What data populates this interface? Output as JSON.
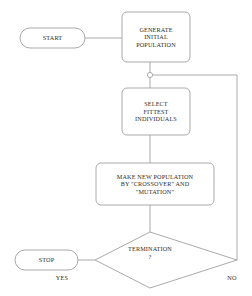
{
  "diagram": {
    "stroke_color": "#a0a0a0",
    "text_color": "#2b2b2b",
    "background_color": "#ffffff",
    "nodes": [
      {
        "id": "start",
        "shape": "stadium",
        "label": "START"
      },
      {
        "id": "generate",
        "shape": "rounded-rect",
        "label": "GENERATE\nINITIAL\nPOPULATION"
      },
      {
        "id": "junction",
        "shape": "circle",
        "label": ""
      },
      {
        "id": "select",
        "shape": "rounded-rect",
        "label": "SELECT\nFITTEST\nINDIVIDUALS"
      },
      {
        "id": "make",
        "shape": "rounded-rect",
        "label": "MAKE NEW POPULATION\nBY \"CROSSOVER\" AND\n\"MUTATION\""
      },
      {
        "id": "termination",
        "shape": "diamond",
        "label": "TERMINATION\n?"
      },
      {
        "id": "stop",
        "shape": "stadium",
        "label": "STOP"
      }
    ],
    "edge_labels": {
      "yes": "YES",
      "no": "NO"
    }
  }
}
